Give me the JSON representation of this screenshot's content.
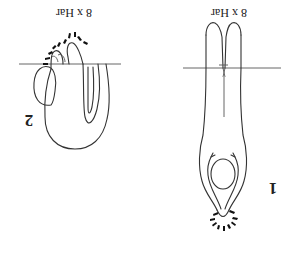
{
  "figure": {
    "orientation": "rotated 180 degrees",
    "panels": [
      {
        "id": "1",
        "number_label": "1",
        "magnification_label": "8 x Har"
      },
      {
        "id": "2",
        "number_label": "2",
        "magnification_label": "8 x Har"
      }
    ]
  },
  "colors": {
    "ink": "#333333",
    "background": "#ffffff"
  }
}
